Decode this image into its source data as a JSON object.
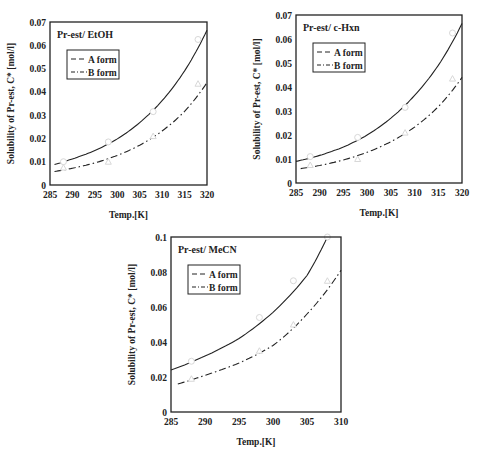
{
  "chart_data": [
    {
      "type": "line",
      "title": "Pr-est/ EtOH",
      "xlabel": "Temp.[K]",
      "ylabel": "Solubility of Pr-est, C* [mol/l]",
      "xlim": [
        285,
        320
      ],
      "ylim": [
        0,
        0.07
      ],
      "xticks": [
        "285",
        "290",
        "295",
        "300",
        "305",
        "310",
        "315",
        "320"
      ],
      "yticks": [
        "0",
        "0.01",
        "0.02",
        "0.03",
        "0.04",
        "0.05",
        "0.06",
        "0.07"
      ],
      "grid": false,
      "legend_position": "upper-left",
      "frame": {
        "left": 50,
        "top": 22,
        "right": 207,
        "bottom": 185
      },
      "series": [
        {
          "name": "A form",
          "style": "solid-line-with-open-circles",
          "curve_x": [
            286,
            290,
            295,
            300,
            305,
            310,
            315,
            320
          ],
          "curve_y": [
            0.0088,
            0.0112,
            0.0148,
            0.0198,
            0.0268,
            0.0362,
            0.049,
            0.0665
          ],
          "points_x": [
            288,
            298,
            308,
            318
          ],
          "points_y": [
            0.01,
            0.0185,
            0.0315,
            0.0625
          ]
        },
        {
          "name": "B form",
          "style": "dash-dot-line-with-open-triangles",
          "curve_x": [
            286,
            290,
            295,
            300,
            305,
            310,
            315,
            320
          ],
          "curve_y": [
            0.0058,
            0.0072,
            0.0095,
            0.0127,
            0.0171,
            0.0232,
            0.0316,
            0.044
          ],
          "points_x": [
            288,
            298,
            308,
            318
          ],
          "points_y": [
            0.0075,
            0.01,
            0.021,
            0.0435
          ]
        }
      ]
    },
    {
      "type": "line",
      "title": "Pr-est/ c-Hxn",
      "xlabel": "Temp.[K]",
      "ylabel": "Solubility of Pr-est, C* [mol/l]",
      "xlim": [
        285,
        320
      ],
      "ylim": [
        0,
        0.07
      ],
      "xticks": [
        "285",
        "290",
        "295",
        "300",
        "305",
        "310",
        "315",
        "320"
      ],
      "yticks": [
        "0",
        "0.01",
        "0.02",
        "0.03",
        "0.04",
        "0.05",
        "0.06",
        "0.07"
      ],
      "grid": false,
      "legend_position": "upper-left",
      "frame": {
        "left": 296,
        "top": 15,
        "right": 462,
        "bottom": 183
      },
      "series": [
        {
          "name": "A form",
          "style": "solid-line-with-open-circles",
          "curve_x": [
            285,
            290,
            295,
            300,
            305,
            310,
            315,
            320
          ],
          "curve_y": [
            0.009,
            0.0115,
            0.015,
            0.02,
            0.027,
            0.0365,
            0.049,
            0.0665
          ],
          "points_x": [
            288,
            298,
            308,
            318
          ],
          "points_y": [
            0.011,
            0.019,
            0.0315,
            0.0625
          ]
        },
        {
          "name": "B form",
          "style": "dash-dot-line-with-open-triangles",
          "curve_x": [
            286,
            290,
            295,
            300,
            305,
            310,
            315,
            320
          ],
          "curve_y": [
            0.006,
            0.0073,
            0.0096,
            0.0128,
            0.0172,
            0.0233,
            0.0318,
            0.044
          ],
          "points_x": [
            288,
            298,
            308,
            318
          ],
          "points_y": [
            0.0075,
            0.01,
            0.021,
            0.0435
          ]
        }
      ]
    },
    {
      "type": "line",
      "title": "Pr-est/ MeCN",
      "xlabel": "Temp.[K]",
      "ylabel": "Solubility of Pr-est, C* [mol/l]",
      "xlim": [
        285,
        310
      ],
      "ylim": [
        0,
        0.1
      ],
      "xticks": [
        "285",
        "290",
        "295",
        "300",
        "305",
        "310"
      ],
      "yticks": [
        "0",
        "0.02",
        "0.04",
        "0.06",
        "0.08",
        "0.1"
      ],
      "grid": false,
      "legend_position": "upper-left",
      "frame": {
        "left": 171,
        "top": 237,
        "right": 341,
        "bottom": 412
      },
      "series": [
        {
          "name": "A form",
          "style": "solid-line-with-open-circles",
          "curve_x": [
            285,
            290,
            295,
            300,
            305,
            308
          ],
          "curve_y": [
            0.024,
            0.032,
            0.042,
            0.057,
            0.078,
            0.1
          ],
          "points_x": [
            288,
            298,
            303,
            308
          ],
          "points_y": [
            0.029,
            0.054,
            0.075,
            0.1
          ]
        },
        {
          "name": "B form",
          "style": "dash-dot-line-with-open-triangles",
          "curve_x": [
            286,
            290,
            295,
            300,
            305,
            310
          ],
          "curve_y": [
            0.016,
            0.021,
            0.028,
            0.038,
            0.056,
            0.081
          ],
          "points_x": [
            288,
            298,
            303,
            308
          ],
          "points_y": [
            0.019,
            0.035,
            0.05,
            0.075
          ]
        }
      ]
    }
  ]
}
